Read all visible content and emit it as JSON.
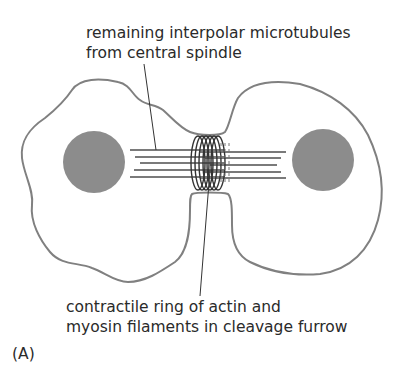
{
  "figure": {
    "panel_label": "(A)",
    "top_label": {
      "line1": "remaining interpolar microtubules",
      "line2": "from central spindle"
    },
    "bottom_label": {
      "line1": "contractile ring of actin and",
      "line2": "myosin filaments in cleavage furrow"
    },
    "colors": {
      "outline": "#808080",
      "nucleus": "#8c8c8c",
      "microtubule": "#7a7a7a",
      "ring": "#333333",
      "text": "#2a2a2a"
    }
  }
}
